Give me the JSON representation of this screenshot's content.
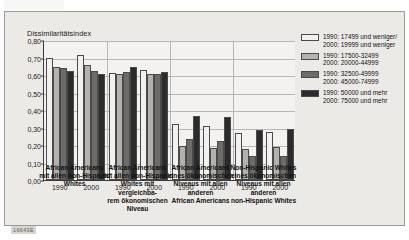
{
  "figure": {
    "footer_code": "16643E"
  },
  "chart_data": {
    "type": "bar",
    "title": "",
    "ylabel": "Dissimilaritätsindex",
    "xlabel": "",
    "ylim": [
      0,
      0.8
    ],
    "ytick_labels": [
      "0,00",
      "0,10",
      "0,20",
      "0,30",
      "0,40",
      "0,50",
      "0,60",
      "0,70",
      "0,80"
    ],
    "ytick_values": [
      0,
      0.1,
      0.2,
      0.3,
      0.4,
      0.5,
      0.6,
      0.7,
      0.8
    ],
    "grid": true,
    "legend_position": "right",
    "series": [
      {
        "name": "1990: 17499 und weniger/\n2000: 19999 und weniger",
        "line1": "1990: 17499 und weniger/",
        "line2": "2000: 19999 und weniger",
        "color": "#f2f1ef",
        "values": [
          0.695,
          0.715,
          0.61,
          0.63,
          0.32,
          0.31,
          0.27,
          0.275
        ]
      },
      {
        "name": "1990: 17500-32499 / 2000: 20000-44999",
        "line1": "1990: 17500-32499",
        "line2": "2000: 20000-44999",
        "color": "#b4b2ae",
        "values": [
          0.645,
          0.655,
          0.605,
          0.605,
          0.195,
          0.185,
          0.175,
          0.19
        ]
      },
      {
        "name": "1990: 32500-49999 / 2000: 45000-74999",
        "line1": "1990: 32500-49999",
        "line2": "2000: 45000-74999",
        "color": "#6e6c69",
        "values": [
          0.64,
          0.625,
          0.62,
          0.605,
          0.235,
          0.225,
          0.135,
          0.135
        ]
      },
      {
        "name": "1990: 50000 und mehr / 2000: 75000 und mehr",
        "line1": "1990: 50000 und mehr",
        "line2": "2000: 75000 und mehr",
        "color": "#2b2b2b",
        "values": [
          0.625,
          0.605,
          0.645,
          0.62,
          0.365,
          0.36,
          0.285,
          0.29
        ]
      }
    ],
    "x_years": [
      "1990",
      "2000",
      "1990",
      "2000",
      "1990",
      "2000",
      "1990",
      "2000"
    ],
    "groups": [
      {
        "line1": "African Americans",
        "line2": "mit allen non-Hispanic",
        "line3": "Whites",
        "line4": ""
      },
      {
        "line1": "African Americans",
        "line2": "mit allen non-Hispanic",
        "line3": "Whites mit vergleichba-",
        "line4": "rem ökonomischen Niveau"
      },
      {
        "line1": "African Americans",
        "line2": "eines ökonomischen",
        "line3": "Niveaus mit allen anderen",
        "line4": "African Americans"
      },
      {
        "line1": "Non-Hispanic Whites",
        "line2": "eines ökonomischen",
        "line3": "Niveaus mit allen anderen",
        "line4": "non-Hispanic Whites"
      }
    ]
  }
}
